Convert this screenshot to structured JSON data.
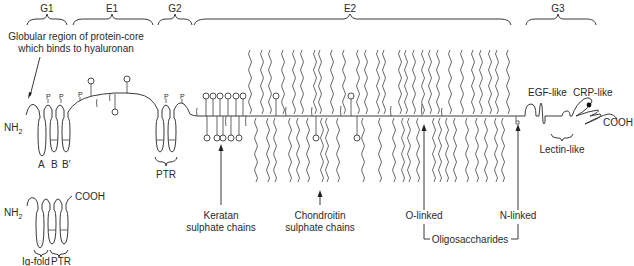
{
  "regions": {
    "g1": "G1",
    "e1": "E1",
    "g2": "G2",
    "e2": "E2",
    "g3": "G3"
  },
  "labels": {
    "globular_line1": "Globular region of protein-core",
    "globular_line2": "which binds to hyaluronan",
    "nh2_main": "NH",
    "nh2_sub": "2",
    "loop_a": "A",
    "loop_b": "B",
    "loop_b_prime": "B′",
    "ptr_g2": "PTR",
    "egf_like": "EGF-like",
    "crp_like": "CRP-like",
    "lectin_like": "Lectin-like",
    "cooh_main": "COOH",
    "keratan_line1": "Keratan",
    "keratan_line2": "sulphate chains",
    "chondroitin_line1": "Chondroitin",
    "chondroitin_line2": "sulphate chains",
    "o_linked": "O-linked",
    "n_linked": "N-linked",
    "oligosaccharides": "Oligosaccharides",
    "phosphate_marker": "P"
  },
  "link_protein": {
    "nh2_main": "NH",
    "nh2_sub": "2",
    "cooh": "COOH",
    "ig_fold": "Ig-fold",
    "ptr": "PTR"
  },
  "colors": {
    "line": "#3a3a3a",
    "chain": "#5a5a5a",
    "text": "#2a2a2a",
    "background": "#ffffff"
  }
}
